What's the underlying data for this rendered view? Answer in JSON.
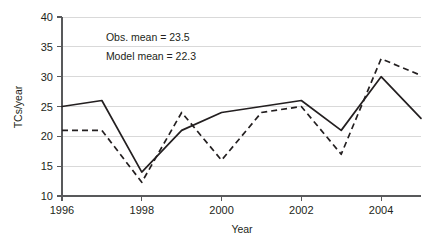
{
  "chart_data": {
    "type": "line",
    "title": "",
    "xlabel": "Year",
    "ylabel": "TCs/year",
    "x": [
      1996,
      1997,
      1998,
      1999,
      2000,
      2001,
      2002,
      2003,
      2004,
      2005
    ],
    "xlim": [
      1996,
      2005
    ],
    "ylim": [
      10,
      40
    ],
    "xticks": [
      1996,
      1998,
      2000,
      2002,
      2004
    ],
    "xtick_labels": [
      "1996",
      "1998",
      "2000",
      "2002",
      "2004"
    ],
    "yticks": [
      10,
      15,
      20,
      25,
      30,
      35,
      40
    ],
    "ytick_labels": [
      "10",
      "15",
      "20",
      "25",
      "30",
      "35",
      "40"
    ],
    "grid": "horizontal",
    "legend": "none",
    "series": [
      {
        "name": "Observed",
        "style": "solid",
        "color": "#231f20",
        "values": [
          25,
          26,
          14,
          21,
          24,
          25,
          26,
          21,
          30,
          23
        ]
      },
      {
        "name": "Model",
        "style": "dashed",
        "color": "#231f20",
        "values": [
          21,
          21,
          12.3,
          24,
          16,
          24,
          25,
          17,
          33,
          30.2
        ]
      }
    ],
    "annotations": [
      {
        "text": "Obs. mean = 23.5",
        "x": 1997.1,
        "y": 36.6
      },
      {
        "text": "Model mean = 22.3",
        "x": 1997.1,
        "y": 33.4
      }
    ]
  }
}
